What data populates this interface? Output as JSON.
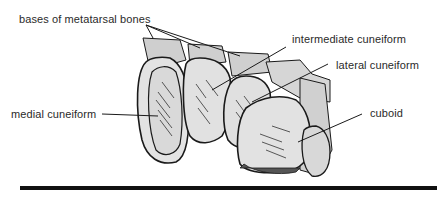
{
  "diagram": {
    "labels": {
      "metatarsal_bases": "bases of metatarsal bones",
      "intermediate_cuneiform": "intermediate cuneiform",
      "lateral_cuneiform": "lateral cuneiform",
      "medial_cuneiform": "medial cuneiform",
      "cuboid": "cuboid"
    },
    "colors": {
      "bone_fill": "#dcdcdc",
      "metatarsal_fill": "#cfcfcf",
      "outline": "#1a1a1a",
      "ground_line": "#111111",
      "text": "#2a2a2a"
    }
  }
}
